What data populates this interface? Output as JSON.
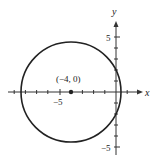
{
  "figure": {
    "type": "circle-on-coordinate-plane",
    "axes": {
      "x_label": "x",
      "y_label": "y",
      "x_tick_label": "−5",
      "y_tick_top_label": "5",
      "y_tick_bottom_label": "−5"
    },
    "center": {
      "label": "(−4, 0)",
      "x": -4,
      "y": 0
    },
    "radius_approx": 4.5,
    "colors": {
      "stroke": "#222222",
      "background": "#ffffff"
    }
  }
}
